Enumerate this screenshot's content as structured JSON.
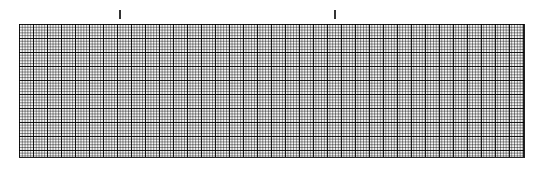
{
  "figure": {
    "type": "ecg-grid-paper",
    "grid": {
      "major_spacing_px": 14,
      "minor_spacing_px": 2.8,
      "minor_per_major": 5,
      "line_color": "#000000",
      "background_color": "#f4f4f4"
    },
    "markers": [
      {
        "name": "tick-1",
        "x_px": 120
      },
      {
        "name": "tick-2",
        "x_px": 335
      }
    ]
  }
}
